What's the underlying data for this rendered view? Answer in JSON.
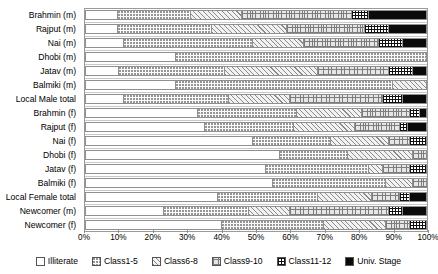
{
  "chart_data": {
    "type": "bar",
    "subtype": "horizontal stacked bar (100%)",
    "title": "",
    "xlabel": "",
    "ylabel": "",
    "xlim": [
      0,
      100
    ],
    "grid": false,
    "legend_position": "bottom",
    "stacked": true,
    "orientation": "horizontal",
    "xtick_labels": [
      "0%",
      "10%",
      "20%",
      "30%",
      "40%",
      "50%",
      "60%",
      "70%",
      "80%",
      "90%",
      "100%"
    ],
    "xtick_values": [
      0,
      10,
      20,
      30,
      40,
      50,
      60,
      70,
      80,
      90,
      100
    ],
    "categories": [
      "Brahmin (m)",
      "Rajput (m)",
      "Nai (m)",
      "Dhobi (m)",
      "Jatav (m)",
      "Balmiki (m)",
      "Local Male total",
      "Brahmin (f)",
      "Rajput (f)",
      "Nai (f)",
      "Dhobi (f)",
      "Jatav (f)",
      "Balmiki (f)",
      "Local Female total",
      "Newcomer (m)",
      "Newcomer (f)"
    ],
    "series": [
      {
        "name": "Illiterate",
        "values": [
          9.7,
          9.7,
          11.4,
          26.5,
          9.9,
          26.7,
          11.4,
          33.0,
          35.0,
          49.0,
          57.0,
          53.0,
          55.0,
          39.0,
          23.0,
          40.0
        ]
      },
      {
        "name": "Class1-5",
        "values": [
          21.3,
          27.3,
          37.6,
          73.5,
          31.1,
          63.5,
          30.6,
          29.0,
          26.0,
          23.0,
          20.0,
          30.0,
          33.0,
          29.0,
          25.0,
          30.0
        ]
      },
      {
        "name": "Class6-8",
        "values": [
          15.0,
          22.0,
          15.0,
          0.0,
          27.0,
          9.8,
          18.0,
          19.0,
          18.0,
          17.0,
          19.0,
          4.0,
          8.0,
          16.0,
          12.0,
          18.0
        ]
      },
      {
        "name": "Class9-10",
        "values": [
          32.0,
          23.0,
          22.0,
          0.0,
          21.0,
          0.0,
          27.0,
          14.0,
          13.0,
          6.0,
          4.0,
          8.0,
          4.0,
          8.0,
          29.0,
          7.0
        ]
      },
      {
        "name": "Class11-12",
        "values": [
          5.0,
          7.0,
          7.0,
          0.0,
          7.0,
          0.0,
          6.0,
          3.0,
          2.5,
          5.0,
          0.0,
          5.0,
          0.0,
          3.0,
          4.0,
          5.0
        ]
      },
      {
        "name": "Univ. Stage",
        "values": [
          17.0,
          11.0,
          7.0,
          0.0,
          4.0,
          0.0,
          7.0,
          2.0,
          5.5,
          0.0,
          0.0,
          0.0,
          0.0,
          5.0,
          7.0,
          0.0
        ]
      }
    ],
    "legend": [
      {
        "label": "Illiterate",
        "pattern": "empty-white",
        "key": "illit"
      },
      {
        "label": "Class1-5",
        "pattern": "fine-dots",
        "key": "c15"
      },
      {
        "label": "Class6-8",
        "pattern": "diagonal-hatch",
        "key": "c68"
      },
      {
        "label": "Class9-10",
        "pattern": "fine-grid",
        "key": "c910"
      },
      {
        "label": "Class11-12",
        "pattern": "bold-grid",
        "key": "c1112"
      },
      {
        "label": "Univ. Stage",
        "pattern": "solid-black",
        "key": "univ"
      }
    ],
    "colors": {
      "axis": "#9a9a9a",
      "text": "#000000",
      "univ_stage": "#0a0a0a",
      "background": "#ffffff"
    }
  }
}
